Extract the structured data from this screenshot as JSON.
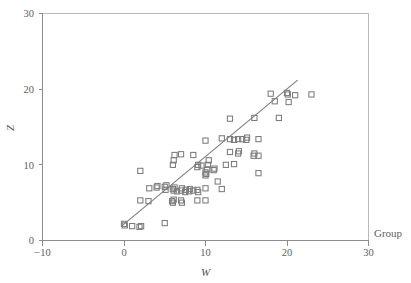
{
  "chart_data": {
    "type": "scatter",
    "title": "",
    "xlabel": "W",
    "ylabel": "Z",
    "xlim": [
      -10,
      30
    ],
    "ylim": [
      0,
      30
    ],
    "xticks": [
      -10,
      0,
      10,
      20,
      30
    ],
    "yticks": [
      0,
      10,
      20,
      30
    ],
    "xtick_labels": [
      "−10",
      "0",
      "10",
      "20",
      "30"
    ],
    "ytick_labels": [
      "0",
      "10",
      "20",
      "30"
    ],
    "grid": false,
    "legend_position": "none",
    "marker": "open-square",
    "marker_color": "#7c7c7c",
    "annotations": [
      {
        "text": "Group",
        "position": "outside-right-bottom"
      }
    ],
    "series": [
      {
        "name": "observations",
        "points": [
          [
            0.0,
            2.2
          ],
          [
            0.1,
            2.0
          ],
          [
            1.0,
            1.9
          ],
          [
            1.9,
            1.8
          ],
          [
            2.1,
            1.9
          ],
          [
            5.0,
            2.3
          ],
          [
            2.0,
            5.3
          ],
          [
            3.0,
            5.2
          ],
          [
            5.9,
            5.2
          ],
          [
            6.0,
            5.0
          ],
          [
            6.1,
            5.4
          ],
          [
            7.0,
            5.3
          ],
          [
            7.1,
            5.0
          ],
          [
            9.0,
            5.3
          ],
          [
            10.0,
            5.3
          ],
          [
            2.0,
            9.2
          ],
          [
            3.1,
            6.9
          ],
          [
            4.0,
            7.0
          ],
          [
            4.1,
            7.2
          ],
          [
            5.0,
            7.1
          ],
          [
            5.1,
            6.7
          ],
          [
            5.2,
            7.3
          ],
          [
            6.0,
            6.8
          ],
          [
            6.1,
            6.6
          ],
          [
            6.2,
            7.0
          ],
          [
            6.5,
            6.5
          ],
          [
            7.0,
            6.6
          ],
          [
            7.1,
            6.9
          ],
          [
            7.5,
            6.4
          ],
          [
            7.6,
            6.7
          ],
          [
            8.0,
            6.5
          ],
          [
            8.1,
            6.8
          ],
          [
            8.5,
            6.6
          ],
          [
            9.0,
            6.7
          ],
          [
            9.1,
            6.4
          ],
          [
            10.0,
            6.9
          ],
          [
            12.0,
            6.8
          ],
          [
            6.0,
            10.0
          ],
          [
            6.1,
            10.6
          ],
          [
            6.2,
            11.3
          ],
          [
            7.0,
            11.4
          ],
          [
            8.5,
            11.3
          ],
          [
            9.0,
            9.7
          ],
          [
            9.1,
            10.0
          ],
          [
            9.5,
            9.9
          ],
          [
            10.0,
            9.0
          ],
          [
            10.1,
            8.8
          ],
          [
            10.2,
            9.4
          ],
          [
            10.3,
            10.0
          ],
          [
            10.4,
            10.6
          ],
          [
            11.0,
            9.3
          ],
          [
            11.1,
            9.5
          ],
          [
            11.5,
            7.8
          ],
          [
            10.0,
            8.6
          ],
          [
            10.0,
            13.2
          ],
          [
            12.0,
            13.5
          ],
          [
            13.0,
            13.4
          ],
          [
            13.5,
            13.3
          ],
          [
            14.0,
            13.4
          ],
          [
            14.5,
            13.4
          ],
          [
            15.0,
            13.3
          ],
          [
            15.1,
            13.6
          ],
          [
            16.5,
            13.4
          ],
          [
            13.0,
            16.1
          ],
          [
            16.0,
            16.2
          ],
          [
            19.0,
            16.2
          ],
          [
            13.0,
            11.7
          ],
          [
            13.5,
            10.1
          ],
          [
            14.0,
            11.5
          ],
          [
            14.1,
            11.8
          ],
          [
            15.9,
            11.2
          ],
          [
            16.0,
            11.5
          ],
          [
            16.5,
            11.2
          ],
          [
            12.5,
            10.0
          ],
          [
            16.5,
            8.9
          ],
          [
            18.0,
            19.4
          ],
          [
            18.5,
            18.4
          ],
          [
            20.0,
            19.5
          ],
          [
            20.1,
            19.3
          ],
          [
            20.2,
            18.3
          ],
          [
            21.0,
            19.2
          ],
          [
            23.0,
            19.3
          ]
        ]
      }
    ],
    "fit_line": {
      "name": "regression-line",
      "x": [
        -0.3,
        21.3
      ],
      "y": [
        1.9,
        21.2
      ],
      "color": "#7d7d7d"
    }
  },
  "axes": {
    "x_title": "W",
    "y_title": "Z"
  },
  "labels": {
    "group": "Group"
  }
}
